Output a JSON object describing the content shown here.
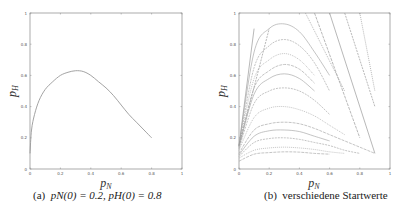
{
  "chart_data": [
    {
      "type": "line",
      "panel": "a",
      "title": "",
      "caption": "(a)  p_N(0) = 0.2, p_H(0) = 0.8",
      "caption_label": "(a)",
      "caption_text": "pN(0) = 0.2, pH(0) = 0.8",
      "xlabel": "p_N",
      "ylabel": "p_H",
      "xlim": [
        0,
        1
      ],
      "ylim": [
        0,
        1
      ],
      "xticks": [
        "0",
        "0.2",
        "0.4",
        "0.6",
        "0.8",
        "1"
      ],
      "yticks": [
        "0",
        "0.2",
        "0.4",
        "0.6",
        "0.8",
        "1"
      ],
      "grid": false,
      "series": [
        {
          "name": "trajectory",
          "x": [
            0.0,
            0.01,
            0.03,
            0.06,
            0.1,
            0.15,
            0.2,
            0.25,
            0.3,
            0.35,
            0.4,
            0.45,
            0.5,
            0.55,
            0.6,
            0.65,
            0.7,
            0.75,
            0.8
          ],
          "y": [
            0.1,
            0.25,
            0.35,
            0.44,
            0.51,
            0.56,
            0.6,
            0.62,
            0.63,
            0.625,
            0.6,
            0.56,
            0.52,
            0.47,
            0.41,
            0.35,
            0.3,
            0.25,
            0.2
          ]
        }
      ]
    },
    {
      "type": "line",
      "panel": "b",
      "title": "",
      "caption": "(b)  verschiedene Startwerte",
      "caption_label": "(b)",
      "caption_text": "verschiedene Startwerte",
      "xlabel": "p_N",
      "ylabel": "p_H",
      "xlim": [
        0,
        1
      ],
      "ylim": [
        0,
        1
      ],
      "xticks": [
        "0",
        "0.2",
        "0.4",
        "0.6",
        "0.8",
        "1"
      ],
      "yticks": [
        "0",
        "0.2",
        "0.4",
        "0.6",
        "0.8",
        "1"
      ],
      "grid": false,
      "series_description": "Family of trajectories from various starting values; humped curves peaking near pN≈0.3 with peak heights from ~0.1 to ~0.93, steep lines near the origin, and descending lines from the top edge toward the lower right.",
      "series": [
        {
          "name": "peak 0.93",
          "x": [
            0.0,
            0.1,
            0.2,
            0.3,
            0.4,
            0.5,
            0.6
          ],
          "y": [
            0.15,
            0.75,
            0.9,
            0.93,
            0.88,
            0.75,
            0.6
          ]
        },
        {
          "name": "peak 0.83",
          "x": [
            0.0,
            0.1,
            0.2,
            0.3,
            0.4,
            0.5,
            0.6
          ],
          "y": [
            0.15,
            0.65,
            0.79,
            0.83,
            0.79,
            0.68,
            0.5
          ]
        },
        {
          "name": "peak 0.74",
          "x": [
            0.0,
            0.1,
            0.2,
            0.3,
            0.4,
            0.5
          ],
          "y": [
            0.15,
            0.58,
            0.7,
            0.74,
            0.7,
            0.6
          ]
        },
        {
          "name": "peak 0.67",
          "x": [
            0.0,
            0.1,
            0.2,
            0.3,
            0.4,
            0.5
          ],
          "y": [
            0.14,
            0.52,
            0.63,
            0.67,
            0.64,
            0.55
          ]
        },
        {
          "name": "peak 0.61",
          "x": [
            0.0,
            0.1,
            0.2,
            0.3,
            0.4,
            0.5
          ],
          "y": [
            0.14,
            0.48,
            0.58,
            0.61,
            0.58,
            0.5
          ]
        },
        {
          "name": "peak 0.52",
          "x": [
            0.0,
            0.1,
            0.2,
            0.3,
            0.4,
            0.5,
            0.6
          ],
          "y": [
            0.13,
            0.42,
            0.5,
            0.52,
            0.5,
            0.44,
            0.35
          ]
        },
        {
          "name": "peak 0.40",
          "x": [
            0.0,
            0.1,
            0.2,
            0.3,
            0.4,
            0.5,
            0.6,
            0.7
          ],
          "y": [
            0.12,
            0.33,
            0.39,
            0.4,
            0.38,
            0.34,
            0.28,
            0.22
          ]
        },
        {
          "name": "peak 0.30",
          "x": [
            0.0,
            0.1,
            0.2,
            0.3,
            0.4,
            0.5,
            0.6,
            0.7,
            0.8,
            0.9
          ],
          "y": [
            0.1,
            0.25,
            0.29,
            0.3,
            0.29,
            0.26,
            0.22,
            0.18,
            0.14,
            0.1
          ]
        },
        {
          "name": "peak 0.25",
          "x": [
            0.0,
            0.1,
            0.2,
            0.3,
            0.4,
            0.5,
            0.6
          ],
          "y": [
            0.09,
            0.21,
            0.245,
            0.25,
            0.24,
            0.21,
            0.18
          ]
        },
        {
          "name": "peak 0.20",
          "x": [
            0.0,
            0.1,
            0.2,
            0.3,
            0.4,
            0.5,
            0.6,
            0.7,
            0.8
          ],
          "y": [
            0.08,
            0.17,
            0.195,
            0.2,
            0.19,
            0.17,
            0.15,
            0.12,
            0.1
          ]
        },
        {
          "name": "peak 0.14",
          "x": [
            0.0,
            0.1,
            0.2,
            0.3,
            0.4,
            0.5,
            0.6,
            0.7
          ],
          "y": [
            0.07,
            0.12,
            0.135,
            0.14,
            0.135,
            0.125,
            0.11,
            0.1
          ]
        },
        {
          "name": "peak 0.11",
          "x": [
            0.0,
            0.1,
            0.2,
            0.3,
            0.4,
            0.5,
            0.6
          ],
          "y": [
            0.05,
            0.095,
            0.105,
            0.11,
            0.108,
            0.1,
            0.095
          ]
        },
        {
          "name": "steep 1",
          "x": [
            0.0,
            0.1
          ],
          "y": [
            0.15,
            0.9
          ]
        },
        {
          "name": "steep 2",
          "x": [
            0.0,
            0.2
          ],
          "y": [
            0.15,
            0.9
          ]
        },
        {
          "name": "descending 1",
          "x": [
            0.44,
            0.7
          ],
          "y": [
            1.0,
            0.5
          ]
        },
        {
          "name": "descending 2",
          "x": [
            0.5,
            0.8
          ],
          "y": [
            1.0,
            0.2
          ]
        },
        {
          "name": "descending 3",
          "x": [
            0.6,
            0.9
          ],
          "y": [
            1.0,
            0.1
          ]
        },
        {
          "name": "descending 4",
          "x": [
            0.7,
            0.9
          ],
          "y": [
            1.0,
            0.4
          ]
        },
        {
          "name": "descending 5",
          "x": [
            0.8,
            0.9
          ],
          "y": [
            1.0,
            0.5
          ]
        }
      ]
    }
  ]
}
